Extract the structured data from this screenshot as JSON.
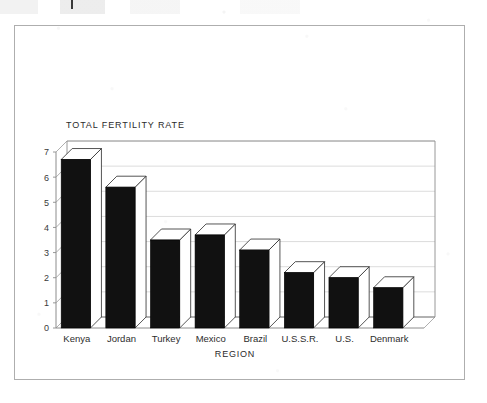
{
  "figure": {
    "title": "TOTAL FERTILITY RATE",
    "xlabel": "REGION",
    "frame_color": "#aeaeae",
    "bar_face_color": "#111111",
    "bar_top_color": "#ffffff",
    "bar_side_color": "#ffffff",
    "gridline_color": "#d8d8d8",
    "axis_color": "#8c8c8c"
  },
  "chart_data": {
    "type": "bar",
    "title": "TOTAL FERTILITY RATE",
    "xlabel": "REGION",
    "ylabel": "",
    "categories": [
      "Kenya",
      "Jordan",
      "Turkey",
      "Mexico",
      "Brazil",
      "U.S.S.R.",
      "U.S.",
      "Denmark"
    ],
    "values": [
      6.7,
      5.6,
      3.5,
      3.7,
      3.1,
      2.2,
      2.0,
      1.6
    ],
    "ylim": [
      0,
      7
    ],
    "yticks": [
      0,
      1,
      2,
      3,
      4,
      5,
      6,
      7
    ],
    "ytick_labels": [
      "0",
      "1",
      "2",
      "3",
      "4",
      "5",
      "6",
      "7"
    ],
    "grid": true,
    "grid_axis": "y",
    "legend": false,
    "style": "3d-bars",
    "series": [
      {
        "name": "Total fertility rate",
        "values": [
          6.7,
          5.6,
          3.5,
          3.7,
          3.1,
          2.2,
          2.0,
          1.6
        ]
      }
    ]
  }
}
